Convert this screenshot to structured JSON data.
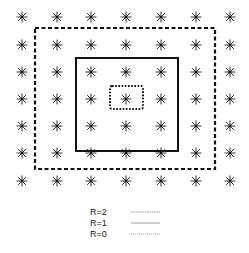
{
  "diagram": {
    "grid": {
      "rows": 7,
      "cols": 7,
      "marker": "asterisk",
      "marker_color": "#333333"
    },
    "regions": [
      {
        "name": "R=2",
        "style": "dashed",
        "color": "#111111",
        "row_span": [
          1,
          5
        ],
        "col_span": [
          0.5,
          5.5
        ]
      },
      {
        "name": "R=1",
        "style": "solid",
        "color": "#111111",
        "row_span": [
          1.5,
          4.8
        ],
        "col_span": [
          1.6,
          4.5
        ]
      },
      {
        "name": "R=0",
        "style": "dotted",
        "color": "#111111",
        "row_span": [
          2.5,
          3.3
        ],
        "col_span": [
          2.6,
          3.5
        ]
      }
    ]
  },
  "legend": {
    "items": [
      {
        "label": "R=2",
        "style": "dashed-thin"
      },
      {
        "label": "R=1",
        "style": "solid-thin"
      },
      {
        "label": "R=0",
        "style": "dotted-thin"
      }
    ]
  }
}
